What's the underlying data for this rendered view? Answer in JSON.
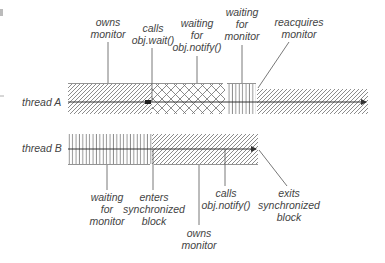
{
  "diagram": {
    "type": "thread-timeline",
    "threads": [
      {
        "label": "thread A",
        "segments": [
          {
            "state": "owns-monitor",
            "pattern": "diagonal",
            "x0": 68,
            "x1": 152
          },
          {
            "state": "waiting-for-notify",
            "pattern": "crosshatch",
            "x0": 152,
            "x1": 225
          },
          {
            "state": "waiting-for-monitor",
            "pattern": "vertical",
            "x0": 227,
            "x1": 256
          },
          {
            "state": "owns-monitor",
            "pattern": "diagonal",
            "x0": 257,
            "x1": 368
          }
        ]
      },
      {
        "label": "thread B",
        "segments": [
          {
            "state": "waiting-for-monitor",
            "pattern": "vertical",
            "x0": 68,
            "x1": 152
          },
          {
            "state": "owns-monitor",
            "pattern": "diagonal",
            "x0": 152,
            "x1": 258
          }
        ]
      }
    ],
    "annotations_top": {
      "owns_monitor": [
        "owns",
        "monitor"
      ],
      "calls_wait": [
        "calls",
        "obj.wait()"
      ],
      "waiting_notify": [
        "waiting",
        "for",
        "obj.notify()"
      ],
      "waiting_monitor": [
        "waiting",
        "for",
        "monitor"
      ],
      "reacquires": [
        "reacquires",
        "monitor"
      ]
    },
    "annotations_bottom": {
      "waiting_monitor": [
        "waiting",
        "for",
        "monitor"
      ],
      "enters_block": [
        "enters",
        "synchronized",
        "block"
      ],
      "owns_monitor": [
        "owns",
        "monitor"
      ],
      "calls_notify": [
        "calls",
        "obj.notify()"
      ],
      "exits_block": [
        "exits",
        "synchronized",
        "block"
      ]
    },
    "colors": {
      "line": "#333333",
      "hatch": "#6e6e6e",
      "text": "#444444",
      "leader": "#555555"
    }
  }
}
